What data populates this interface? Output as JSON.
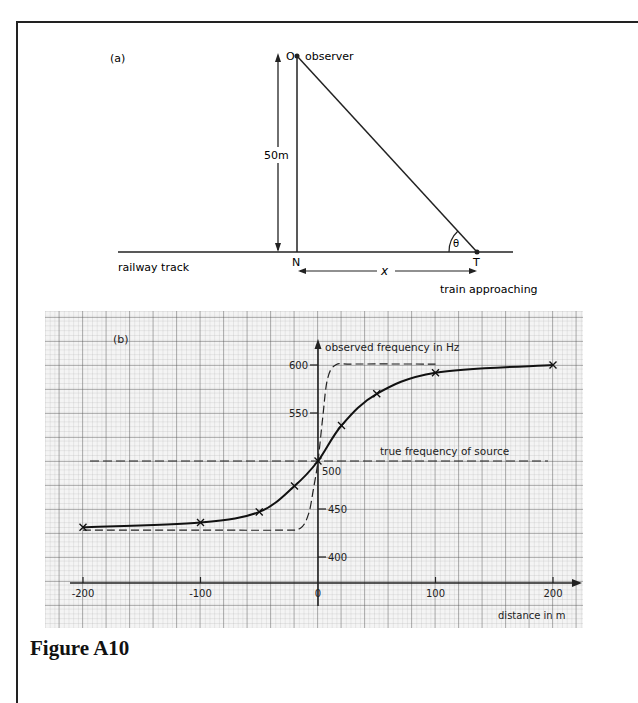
{
  "figure": {
    "caption": "Figure A10"
  },
  "diagram_a": {
    "label": "(a)",
    "observer_point": "O",
    "observer_label": "observer",
    "height_label": "50m",
    "foot_point": "N",
    "train_point": "T",
    "angle_label": "θ",
    "distance_label": "x",
    "track_label": "railway track",
    "train_label": "train approaching"
  },
  "chart_data": {
    "type": "line",
    "panel_label": "(b)",
    "title": "",
    "xlabel": "distance in m",
    "ylabel": "observed frequency in Hz",
    "xlim": [
      -200,
      200
    ],
    "ylim": [
      373,
      625
    ],
    "x_ticks": [
      -200,
      -100,
      0,
      100,
      200
    ],
    "x_tick_labels": [
      "-200",
      "-100",
      "0",
      "100",
      "200"
    ],
    "y_ticks": [
      400,
      450,
      500,
      550,
      600
    ],
    "y_tick_labels": [
      "400",
      "450",
      "500",
      "550",
      "600"
    ],
    "grid": true,
    "annotations": [
      {
        "text": "true frequency of source",
        "y": 500,
        "style": "dashed horizontal line"
      }
    ],
    "series": [
      {
        "name": "observed frequency (measured, 50 m from track)",
        "style": "solid with x markers",
        "x": [
          -200,
          -100,
          -50,
          -20,
          0,
          20,
          50,
          100,
          200
        ],
        "y": [
          431,
          436,
          447,
          474,
          500,
          537,
          570,
          592,
          600
        ]
      },
      {
        "name": "observed frequency (close to track)",
        "style": "dashed",
        "x": [
          -200,
          -100,
          -30,
          -15,
          -8,
          -4,
          0,
          4,
          8,
          15,
          30,
          100
        ],
        "y": [
          428,
          428,
          428,
          430,
          445,
          470,
          500,
          545,
          585,
          600,
          601,
          601
        ]
      }
    ],
    "true_frequency": 500
  }
}
